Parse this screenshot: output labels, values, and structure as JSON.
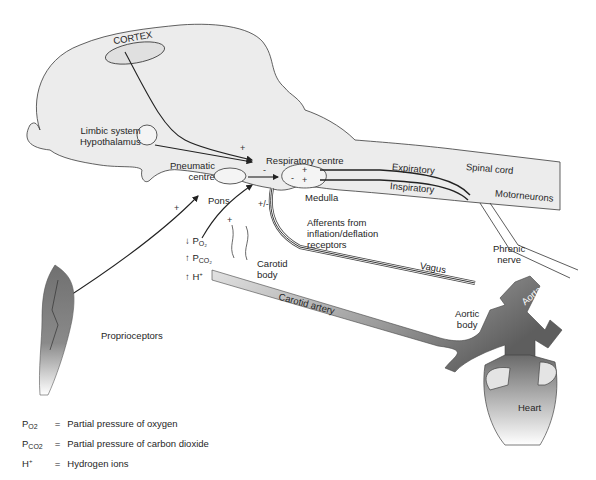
{
  "diagram": {
    "regions": {
      "cortex": "CORTEX",
      "limbic": [
        "Limbic system",
        "Hypothalamus"
      ],
      "pneumatic": [
        "Pneumatic",
        "centre"
      ],
      "pons": "Pons",
      "respiratory_centre": "Respiratory centre",
      "medulla": "Medulla",
      "spinal_cord": "Spinal cord",
      "expiratory": "Expiratory",
      "inspiratory": "Inspiratory",
      "motorneurons": "Motorneurons",
      "phrenic": [
        "Phrenic",
        "nerve"
      ],
      "afferents": [
        "Afferents from",
        "inflation/deflation",
        "receptors"
      ],
      "vagus": "Vagus",
      "carotid_body": [
        "Carotid",
        "body"
      ],
      "carotid_artery": "Carotid artery",
      "aortic_body": [
        "Aortic",
        "body"
      ],
      "aorta": "Aorta",
      "heart": "Heart",
      "proprioceptors": "Proprioceptors"
    },
    "stimuli": [
      {
        "arrow": "↓",
        "label": "P",
        "sub": "O₂"
      },
      {
        "arrow": "↑",
        "label": "P",
        "sub": "CO₂"
      },
      {
        "arrow": "↑",
        "label": "H",
        "sup": "+"
      }
    ],
    "signs": {
      "cortex_plus": "+",
      "pneumatic_minus": "-",
      "proprio_plus": "+",
      "chemo_plus": "+",
      "vagus_plusminus": "+/-",
      "resp_plus1": "+",
      "resp_plus2": "+",
      "resp_minus": "-"
    },
    "colors": {
      "brain_fill": "#ececec",
      "outline": "#3a3a3a",
      "vessel_dark": "#6b6b6b",
      "vessel_light": "#d8d8d8"
    }
  },
  "legend": [
    {
      "symbol": "P",
      "sub": "O2",
      "eq": "=",
      "text": "Partial pressure of oxygen"
    },
    {
      "symbol": "P",
      "sub": "CO2",
      "eq": "=",
      "text": "Partial pressure of carbon dioxide"
    },
    {
      "symbol": "H",
      "sup": "+",
      "eq": "=",
      "text": "Hydrogen ions"
    }
  ]
}
